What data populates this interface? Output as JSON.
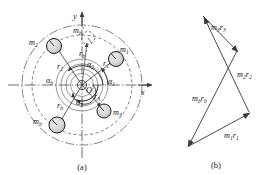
{
  "figure": {
    "panels": [
      {
        "id": "a",
        "caption": "(a)",
        "description": "rotor disc with unbalanced masses"
      },
      {
        "id": "b",
        "caption": "(b)",
        "description": "vector polygon of mass-radius products"
      }
    ]
  },
  "panel_a": {
    "axes": {
      "x_label": "x",
      "y_label": "y",
      "origin_label": "O"
    },
    "masses": [
      {
        "name": "m1",
        "base": "m",
        "sub": "1",
        "cx": 116,
        "cy": 59,
        "r": 7.5
      },
      {
        "name": "m2",
        "base": "m",
        "sub": "2",
        "cx": 54,
        "cy": 46,
        "r": 7.5
      },
      {
        "name": "m3",
        "base": "m",
        "sub": "3",
        "cx": 104,
        "cy": 111,
        "r": 7.0
      },
      {
        "name": "mb",
        "base": "m",
        "sub": "b",
        "cx": 57,
        "cy": 125,
        "r": 8.0
      },
      {
        "name": "mb_prime",
        "base": "m",
        "sub": "b",
        "prime": true,
        "cx": 88,
        "cy": 38,
        "r": 6.5
      }
    ],
    "mass_labels": [
      {
        "text": "m1",
        "base": "m",
        "sub": "1",
        "x": 120,
        "y": 52
      },
      {
        "text": "m2",
        "base": "m",
        "sub": "2",
        "x": 33,
        "y": 45
      },
      {
        "text": "m3",
        "base": "m",
        "sub": "3",
        "x": 114,
        "y": 114
      },
      {
        "text": "mb",
        "base": "m",
        "sub": "b",
        "x": 38,
        "y": 123
      },
      {
        "text": "mb'",
        "base": "m",
        "sub": "b",
        "prime": true,
        "x": 78,
        "y": 33
      }
    ],
    "radius_labels": [
      {
        "text": "r1",
        "base": "r",
        "sub": "1",
        "x": 104,
        "y": 65
      },
      {
        "text": "r2",
        "base": "r",
        "sub": "2",
        "x": 60,
        "y": 68
      },
      {
        "text": "r3",
        "base": "r",
        "sub": "3",
        "x": 96,
        "y": 98
      },
      {
        "text": "rb",
        "base": "r",
        "sub": "b",
        "x": 60,
        "y": 107
      },
      {
        "text": "rb'",
        "base": "r",
        "sub": "b",
        "prime": true,
        "x": 83,
        "y": 55
      }
    ],
    "angle_labels": [
      {
        "text": "alpha1",
        "base": "α",
        "sub": "1",
        "x": 110,
        "y": 84
      },
      {
        "text": "alpha2",
        "base": "α",
        "sub": "2",
        "x": 90,
        "y": 66
      },
      {
        "text": "alpha3",
        "base": "α",
        "sub": "3",
        "x": 79,
        "y": 104
      },
      {
        "text": "alphab",
        "base": "α",
        "sub": "b",
        "x": 51,
        "y": 83
      }
    ],
    "disc": {
      "cx": 82,
      "cy": 85,
      "outer_r": 60,
      "inner_r": 50
    }
  },
  "panel_b": {
    "vectors": [
      {
        "name": "m3r3",
        "base": "m",
        "sub1": "3",
        "base2": "r",
        "sub2": "3",
        "x1": 238,
        "y1": 53,
        "x2": 202,
        "y2": 14,
        "lx": 220,
        "ly": 26
      },
      {
        "name": "m2r2",
        "base": "m",
        "sub1": "2",
        "base2": "r",
        "sub2": "2",
        "x1": 249,
        "y1": 112,
        "x2": 203,
        "y2": 16,
        "lx": 240,
        "ly": 74
      },
      {
        "name": "m1r1",
        "base": "m",
        "sub1": "1",
        "base2": "r",
        "sub2": "1",
        "x1": 189,
        "y1": 146,
        "x2": 250,
        "y2": 113,
        "lx": 232,
        "ly": 137
      },
      {
        "name": "mbrb",
        "base": "m",
        "sub1": "b",
        "base2": "r",
        "sub2": "b",
        "x1": 237,
        "y1": 52,
        "x2": 188,
        "y2": 147,
        "lx": 200,
        "ly": 100
      }
    ]
  },
  "colors": {
    "line": "#3a3a3a",
    "mass_fill": "#d4d4d4",
    "mass_stroke": "#1f1f1f",
    "axis": "#4a4a4a",
    "text": "#222222",
    "background": "#ffffff"
  }
}
